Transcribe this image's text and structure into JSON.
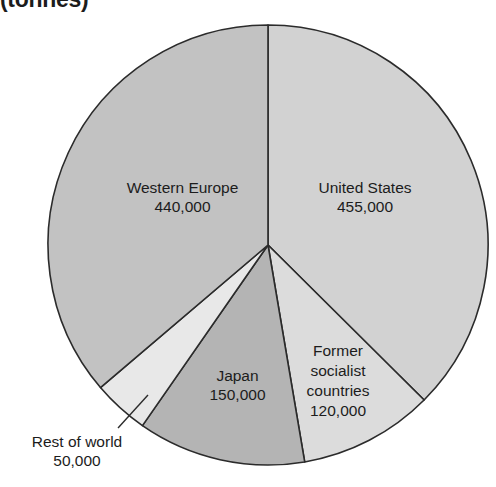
{
  "chart_data": {
    "type": "pie",
    "title": "(tonnes)",
    "xlabel": "",
    "ylabel": "",
    "total": 1215000,
    "units": "tonnes",
    "legend_position": "none",
    "grid": false,
    "labels_inside_slices": true,
    "categories": [
      "United States",
      "Former socialist countries",
      "Japan",
      "Rest of world",
      "Western Europe"
    ],
    "values": [
      455000,
      120000,
      150000,
      50000,
      440000
    ],
    "value_labels": [
      "455,000",
      "120,000",
      "150,000",
      "50,000",
      "440,000"
    ],
    "slices": [
      {
        "name": "United States",
        "value": 455000,
        "value_label": "455,000",
        "color": "#d2d2d2",
        "start_angle": 0,
        "end_angle": 134.8
      },
      {
        "name": "Former socialist countries",
        "value": 120000,
        "value_label": "120,000",
        "color": "#dcdcdc",
        "start_angle": 134.8,
        "end_angle": 170.4
      },
      {
        "name": "Japan",
        "value": 150000,
        "value_label": "150,000",
        "color": "#b4b4b4",
        "start_angle": 170.4,
        "end_angle": 214.8
      },
      {
        "name": "Rest of world",
        "value": 50000,
        "value_label": "50,000",
        "color": "#e8e8e8",
        "start_angle": 214.8,
        "end_angle": 229.6
      },
      {
        "name": "Western Europe",
        "value": 440000,
        "value_label": "440,000",
        "color": "#c2c2c2",
        "start_angle": 229.6,
        "end_angle": 360
      }
    ],
    "stroke_color": "#2b2b2b",
    "leader_lines": [
      {
        "for": "Rest of world",
        "from_x": 148,
        "from_y": 395,
        "to_x": 118,
        "to_y": 428
      }
    ]
  }
}
